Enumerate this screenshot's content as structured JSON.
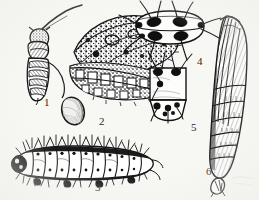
{
  "plate": {
    "kind": "entomological-life-cycle-plate",
    "style": "black-and-white engraving",
    "background_color": "#f7f7f4",
    "ink_color": "#1a1a1a",
    "width": 259,
    "height": 200,
    "figures": [
      {
        "number": "1",
        "subject": "adult-moth",
        "description": "Adult moth at rest with mottled speckled forewings, feathered antenna, banded abdomen",
        "label_x": 44,
        "label_y": 97
      },
      {
        "number": "2",
        "subject": "egg",
        "description": "Single oval egg with stippled sculptured chorion",
        "label_x": 99,
        "label_y": 116
      },
      {
        "number": "3",
        "subject": "larva",
        "description": "Mature caterpillar in lateral view, segmented with tufts of setae along the body",
        "label_x": 95,
        "label_y": 182
      },
      {
        "number": "4",
        "subject": "larval-segment-dorsal",
        "description": "Enlarged dorsal view of a larval body segment showing four dark tubercles with radiating setae",
        "label_x": 197,
        "label_y": 56
      },
      {
        "number": "5",
        "subject": "larval-anal-segment",
        "description": "Enlarged view of the larval anal segment with pinacula and setae",
        "label_x": 191,
        "label_y": 122
      },
      {
        "number": "6",
        "subject": "pupa",
        "description": "Pupa in lateral view showing wing cases and segmented abdomen ending in a cremaster",
        "label_x": 206,
        "label_y": 166
      }
    ]
  }
}
